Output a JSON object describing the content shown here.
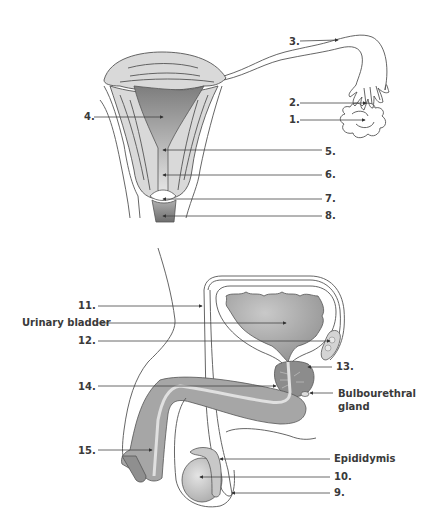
{
  "female_diagram": {
    "labels": [
      {
        "id": "1",
        "text": "1.",
        "x": 290,
        "y": 123,
        "target": [
          365,
          119
        ]
      },
      {
        "id": "2",
        "text": "2.",
        "x": 290,
        "y": 106,
        "target": [
          366,
          103
        ]
      },
      {
        "id": "3",
        "text": "3.",
        "x": 290,
        "y": 45,
        "target": [
          338,
          40
        ]
      },
      {
        "id": "4",
        "text": "4.",
        "x": 84,
        "y": 120,
        "target": [
          163,
          116
        ]
      },
      {
        "id": "5",
        "text": "5.",
        "x": 325,
        "y": 155,
        "target": [
          163,
          149
        ]
      },
      {
        "id": "6",
        "text": "6.",
        "x": 325,
        "y": 178,
        "target": [
          163,
          174
        ]
      },
      {
        "id": "7",
        "text": "7.",
        "x": 325,
        "y": 202,
        "target": [
          163,
          199
        ]
      },
      {
        "id": "8",
        "text": "8.",
        "x": 325,
        "y": 219,
        "target": [
          163,
          216
        ]
      }
    ]
  },
  "male_diagram": {
    "labels": [
      {
        "id": "11",
        "text": "11.",
        "x": 80,
        "y": 309,
        "target": [
          202,
          305
        ]
      },
      {
        "id": "urinary_bladder",
        "text": "Urinary bladder",
        "x": 22,
        "y": 326,
        "target": [
          286,
          322
        ]
      },
      {
        "id": "12",
        "text": "12.",
        "x": 80,
        "y": 344,
        "target": [
          332,
          340
        ]
      },
      {
        "id": "13",
        "text": "13.",
        "x": 336,
        "y": 370,
        "target": [
          308,
          368
        ]
      },
      {
        "id": "14",
        "text": "14.",
        "x": 80,
        "y": 390,
        "target": [
          278,
          386
        ]
      },
      {
        "id": "bulbourethral_gland",
        "text": "Bulbourethral",
        "text2": "gland",
        "x": 338,
        "y": 397,
        "target": [
          310,
          393
        ]
      },
      {
        "id": "15",
        "text": "15.",
        "x": 80,
        "y": 454,
        "target": [
          154,
          450
        ]
      },
      {
        "id": "epididymis",
        "text": "Epididymis",
        "x": 334,
        "y": 462,
        "target": [
          220,
          459
        ]
      },
      {
        "id": "10",
        "text": "10.",
        "x": 334,
        "y": 480,
        "target": [
          200,
          477
        ]
      },
      {
        "id": "9",
        "text": "9.",
        "x": 334,
        "y": 496,
        "target": [
          230,
          493
        ]
      }
    ]
  },
  "colors": {
    "tissue_light": "#d9d9d9",
    "tissue_mid": "#a6a6a6",
    "tissue_dark": "#8c8c8c",
    "outline": "#555555",
    "label_text": "#3a3a3a"
  }
}
